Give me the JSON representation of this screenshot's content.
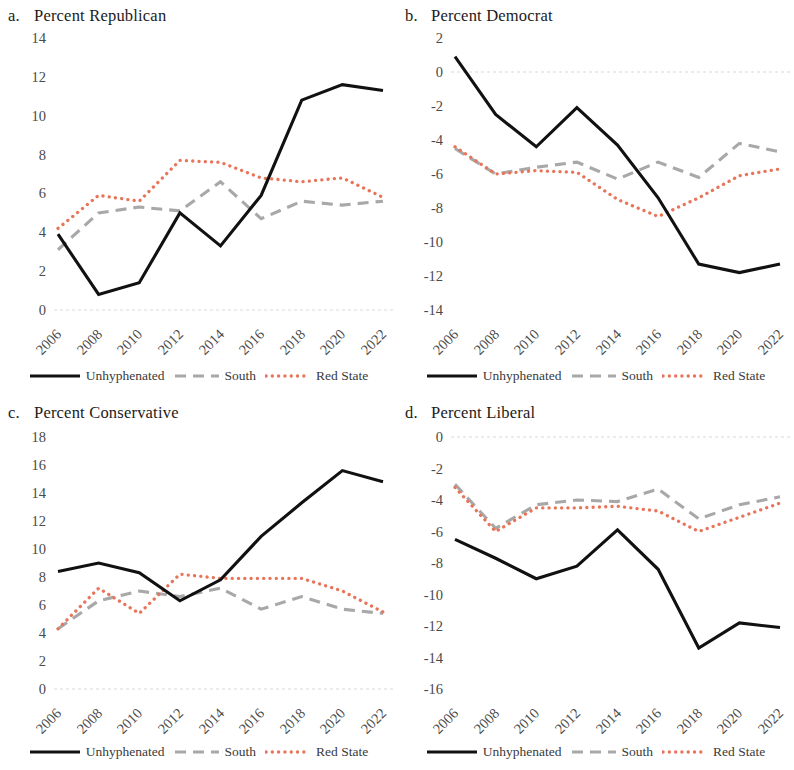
{
  "figure": {
    "legend": {
      "items": [
        {
          "key": "unhyphenated",
          "label": "Unhyphenated",
          "style": "solid",
          "color": "#111111"
        },
        {
          "key": "south",
          "label": "South",
          "style": "dashed",
          "color": "#a8a8a8"
        },
        {
          "key": "red_state",
          "label": "Red State",
          "style": "dotted",
          "color": "#e8755a"
        }
      ]
    },
    "panels": [
      {
        "letter": "a.",
        "title": "Percent Republican"
      },
      {
        "letter": "b.",
        "title": "Percent Democrat"
      },
      {
        "letter": "c.",
        "title": "Percent Conservative"
      },
      {
        "letter": "d.",
        "title": "Percent Liberal"
      }
    ]
  },
  "chart_data": [
    {
      "panel": "a",
      "type": "line",
      "title": "Percent Republican",
      "letter": "a.",
      "xlabel": "",
      "ylabel": "",
      "x": [
        2006,
        2008,
        2010,
        2012,
        2014,
        2016,
        2018,
        2020,
        2022
      ],
      "categories": [
        "2006",
        "2008",
        "2010",
        "2012",
        "2014",
        "2016",
        "2018",
        "2020",
        "2022"
      ],
      "ylim": [
        0,
        14
      ],
      "yticks": [
        0,
        2,
        4,
        6,
        8,
        10,
        12,
        14
      ],
      "grid": false,
      "zero_line": true,
      "legend_position": "bottom",
      "series": [
        {
          "name": "Unhyphenated",
          "style": "solid",
          "color": "#111111",
          "values": [
            3.9,
            0.8,
            1.4,
            5.0,
            3.3,
            5.9,
            10.8,
            11.6,
            11.3
          ]
        },
        {
          "name": "South",
          "style": "dashed",
          "color": "#a8a8a8",
          "values": [
            3.1,
            5.0,
            5.3,
            5.1,
            6.6,
            4.7,
            5.6,
            5.4,
            5.6
          ]
        },
        {
          "name": "Red State",
          "style": "dotted",
          "color": "#e8755a",
          "values": [
            4.2,
            5.9,
            5.6,
            7.7,
            7.6,
            6.8,
            6.6,
            6.8,
            5.8
          ]
        }
      ]
    },
    {
      "panel": "b",
      "type": "line",
      "title": "Percent Democrat",
      "letter": "b.",
      "xlabel": "",
      "ylabel": "",
      "x": [
        2006,
        2008,
        2010,
        2012,
        2014,
        2016,
        2018,
        2020,
        2022
      ],
      "categories": [
        "2006",
        "2008",
        "2010",
        "2012",
        "2014",
        "2016",
        "2018",
        "2020",
        "2022"
      ],
      "ylim": [
        -14,
        2
      ],
      "yticks": [
        2,
        0,
        -2,
        -4,
        -6,
        -8,
        -10,
        -12,
        -14
      ],
      "grid": false,
      "zero_line": true,
      "legend_position": "bottom",
      "series": [
        {
          "name": "Unhyphenated",
          "style": "solid",
          "color": "#111111",
          "values": [
            0.9,
            -2.5,
            -4.4,
            -2.1,
            -4.3,
            -7.4,
            -11.3,
            -11.8,
            -11.3
          ]
        },
        {
          "name": "South",
          "style": "dashed",
          "color": "#a8a8a8",
          "values": [
            -4.5,
            -6.0,
            -5.6,
            -5.3,
            -6.3,
            -5.3,
            -6.2,
            -4.2,
            -4.7
          ]
        },
        {
          "name": "Red State",
          "style": "dotted",
          "color": "#e8755a",
          "values": [
            -4.4,
            -6.0,
            -5.8,
            -5.9,
            -7.5,
            -8.5,
            -7.4,
            -6.1,
            -5.7
          ]
        }
      ]
    },
    {
      "panel": "c",
      "type": "line",
      "title": "Percent Conservative",
      "letter": "c.",
      "xlabel": "",
      "ylabel": "",
      "x": [
        2006,
        2008,
        2010,
        2012,
        2014,
        2016,
        2018,
        2020,
        2022
      ],
      "categories": [
        "2006",
        "2008",
        "2010",
        "2012",
        "2014",
        "2016",
        "2018",
        "2020",
        "2022"
      ],
      "ylim": [
        0,
        18
      ],
      "yticks": [
        0,
        2,
        4,
        6,
        8,
        10,
        12,
        14,
        16,
        18
      ],
      "grid": false,
      "zero_line": true,
      "legend_position": "bottom",
      "series": [
        {
          "name": "Unhyphenated",
          "style": "solid",
          "color": "#111111",
          "values": [
            8.4,
            9.0,
            8.3,
            6.3,
            7.8,
            10.9,
            13.3,
            15.6,
            14.8
          ]
        },
        {
          "name": "South",
          "style": "dashed",
          "color": "#a8a8a8",
          "values": [
            4.3,
            6.3,
            7.0,
            6.6,
            7.2,
            5.7,
            6.6,
            5.7,
            5.4
          ]
        },
        {
          "name": "Red State",
          "style": "dotted",
          "color": "#e8755a",
          "values": [
            4.3,
            7.2,
            5.4,
            8.2,
            7.9,
            7.9,
            7.9,
            7.0,
            5.5
          ]
        }
      ]
    },
    {
      "panel": "d",
      "type": "line",
      "title": "Percent Liberal",
      "letter": "d.",
      "xlabel": "",
      "ylabel": "",
      "x": [
        2006,
        2008,
        2010,
        2012,
        2014,
        2016,
        2018,
        2020,
        2022
      ],
      "categories": [
        "2006",
        "2008",
        "2010",
        "2012",
        "2014",
        "2016",
        "2018",
        "2020",
        "2022"
      ],
      "ylim": [
        -16,
        0
      ],
      "yticks": [
        0,
        -2,
        -4,
        -6,
        -8,
        -10,
        -12,
        -14,
        -16
      ],
      "grid": false,
      "zero_line": true,
      "legend_position": "bottom",
      "series": [
        {
          "name": "Unhyphenated",
          "style": "solid",
          "color": "#111111",
          "values": [
            -6.5,
            -7.7,
            -9.0,
            -8.2,
            -5.9,
            -8.4,
            -13.4,
            -11.8,
            -12.1
          ]
        },
        {
          "name": "South",
          "style": "dashed",
          "color": "#a8a8a8",
          "values": [
            -3.0,
            -5.8,
            -4.3,
            -4.0,
            -4.1,
            -3.3,
            -5.2,
            -4.3,
            -3.8
          ]
        },
        {
          "name": "Red State",
          "style": "dotted",
          "color": "#e8755a",
          "values": [
            -3.2,
            -6.0,
            -4.5,
            -4.5,
            -4.4,
            -4.7,
            -6.0,
            -5.1,
            -4.2
          ]
        }
      ]
    }
  ]
}
